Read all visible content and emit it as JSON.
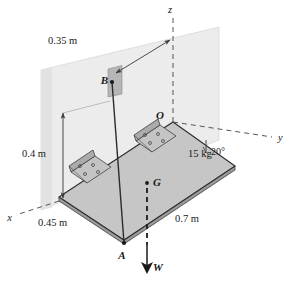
{
  "figure": {
    "background_color": "#ffffff",
    "plate": {
      "mass_label": "15 kg",
      "fill_color": "#c6c6c6",
      "edge_color": "#2b2b2b",
      "side_color": "#9a9a9a"
    },
    "wall": {
      "fill_color": "#ececec",
      "edge_color": "#cfcfcf"
    },
    "hinges": {
      "count": 2,
      "bolt_holes_each": 4,
      "fill_color": "#c0c0c0",
      "edge_color": "#4a4a4a"
    },
    "cable": {
      "from": "B",
      "to": "A",
      "color": "#2b2b2b"
    }
  },
  "points": {
    "O": "O",
    "A": "A",
    "B": "B",
    "G": "G"
  },
  "axes": {
    "x": "x",
    "y": "y",
    "z": "z",
    "style": "dashed",
    "color": "#555555"
  },
  "dimensions": {
    "cable_offset": "0.35 m",
    "wall_height": "0.4 m",
    "plate_short_side": "0.45 m",
    "plate_long_side": "0.7 m"
  },
  "angles": {
    "plate_to_y_axis": "20°"
  },
  "forces": {
    "weight_label": "W",
    "weight_direction": "downward",
    "weight_color": "#1a1a1a"
  },
  "mass": {
    "plate_mass": "15 kg"
  }
}
